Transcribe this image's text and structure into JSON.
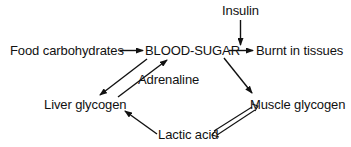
{
  "diagram": {
    "type": "flow",
    "nodes": {
      "insulin": {
        "label": "Insulin"
      },
      "food": {
        "label": "Food carbohydrates"
      },
      "blood_sugar": {
        "label": "BLOOD-SUGAR"
      },
      "burnt": {
        "label": "Burnt in tissues"
      },
      "adrenaline": {
        "label": "Adrenaline"
      },
      "liver": {
        "label": "Liver glycogen"
      },
      "muscle": {
        "label": "Muscle glycogen"
      },
      "lactic": {
        "label": "Lactic acid"
      }
    },
    "edges": [
      {
        "from": "Food carbohydrates",
        "to": "BLOOD-SUGAR",
        "style": "single"
      },
      {
        "from": "BLOOD-SUGAR",
        "to": "Burnt in tissues",
        "style": "single"
      },
      {
        "from": "Insulin",
        "to": "BLOOD-SUGAR → Burnt in tissues",
        "style": "single"
      },
      {
        "from": "BLOOD-SUGAR",
        "to": "Liver glycogen",
        "style": "single"
      },
      {
        "from": "Liver glycogen",
        "to": "BLOOD-SUGAR",
        "style": "single",
        "label": "Adrenaline"
      },
      {
        "from": "BLOOD-SUGAR",
        "to": "Muscle glycogen",
        "style": "single"
      },
      {
        "from": "Muscle glycogen",
        "to": "Lactic acid",
        "style": "double-reversible"
      },
      {
        "from": "Lactic acid",
        "to": "Liver glycogen",
        "style": "single"
      }
    ],
    "colors": {
      "ink": "#111111",
      "background": "#ffffff"
    }
  }
}
